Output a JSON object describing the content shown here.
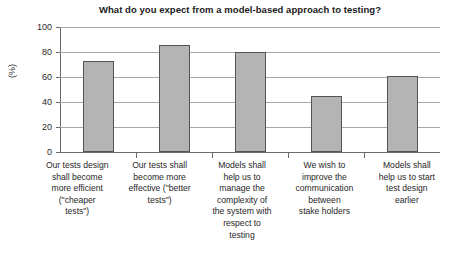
{
  "chart_data": {
    "type": "bar",
    "title": "What do you expect from a model-based approach to testing?",
    "xlabel": "",
    "ylabel": "(%)",
    "ylim": [
      0,
      100
    ],
    "yticks": [
      0,
      20,
      40,
      60,
      80,
      100
    ],
    "grid": true,
    "legend": null,
    "categories": [
      "Our tests design shall become more efficient (\"cheaper tests\")",
      "Our tests shall become more effective (\"better tests\")",
      "Models shall help us to manage the complexity of the system with respect to testing",
      "We wish to improve the communication between stake holders",
      "Models shall help us to start test design earlier"
    ],
    "values": [
      73,
      86,
      80,
      45,
      61
    ],
    "bar_color": "#b4b4b4",
    "bar_edge_color": "#555555"
  },
  "axis": {
    "y_tick_labels": [
      "100",
      "80",
      "60",
      "40",
      "20",
      "0"
    ],
    "y_title": "(%)"
  },
  "category_label_lines": [
    [
      "Our tests design",
      "shall become",
      "more efficient",
      "(\"cheaper",
      "tests\")"
    ],
    [
      "Our tests shall",
      "become more",
      "effective (\"better",
      "tests\")"
    ],
    [
      "Models shall",
      "help us to",
      "manage the",
      "complexity of",
      "the system with",
      "respect to",
      "testing"
    ],
    [
      "We wish to",
      "improve the",
      "communication",
      "between",
      "stake holders"
    ],
    [
      "Models shall",
      "help us to start",
      "test design",
      "earlier"
    ]
  ]
}
